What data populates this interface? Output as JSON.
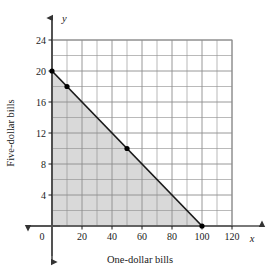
{
  "chart_data": {
    "type": "line",
    "title": "",
    "subtitle": "",
    "xlabel": "One-dollar bills",
    "ylabel": "Five-dollar bills",
    "x_var_symbol": "x",
    "y_var_symbol": "y",
    "xlim": [
      0,
      120
    ],
    "ylim": [
      0,
      24
    ],
    "x_major_ticks": [
      0,
      20,
      40,
      60,
      80,
      100,
      120
    ],
    "x_major_tick_labels": [
      "0",
      "20",
      "40",
      "60",
      "80",
      "100",
      "120"
    ],
    "y_major_ticks": [
      4,
      8,
      12,
      16,
      20,
      24
    ],
    "y_major_tick_labels": [
      "4",
      "8",
      "12",
      "16",
      "20",
      "24"
    ],
    "x_grid_step": 10,
    "y_grid_step": 2,
    "grid": true,
    "legend": "none",
    "series": [
      {
        "name": "boundary line",
        "type": "line",
        "equation": "x + 5y = 100",
        "points": [
          {
            "x": 0,
            "y": 20
          },
          {
            "x": 100,
            "y": 0
          }
        ],
        "color": "#1a1a1a"
      }
    ],
    "marked_points": [
      {
        "x": 0,
        "y": 20
      },
      {
        "x": 10,
        "y": 18
      },
      {
        "x": 50,
        "y": 10
      },
      {
        "x": 100,
        "y": 0
      }
    ],
    "shaded_region": {
      "description": "triangle bounded by the axes and the line",
      "vertices": [
        {
          "x": 0,
          "y": 0
        },
        {
          "x": 0,
          "y": 20
        },
        {
          "x": 100,
          "y": 0
        }
      ],
      "fill_color": "#d9d9d9"
    },
    "colors": {
      "grid": "#8c8c8c",
      "axis": "#4d4d4d",
      "line": "#1a1a1a",
      "shade": "#d9d9d9",
      "background": "#ffffff",
      "point": "#000000"
    }
  }
}
